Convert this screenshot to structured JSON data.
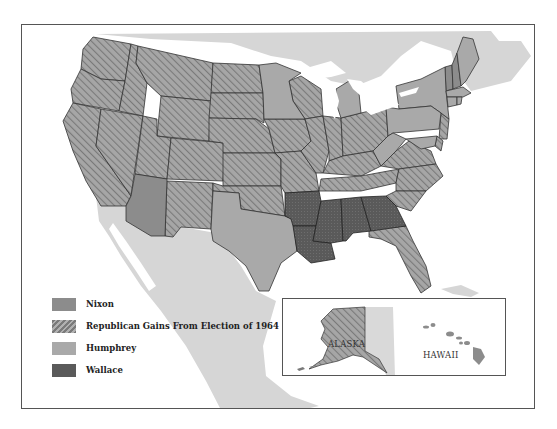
{
  "map": {
    "title": "1968 Presidential Election",
    "colors": {
      "nixon": "#8c8c8c",
      "republican_gain": "#9a9a9a",
      "humphrey": "#a9a9a9",
      "wallace": "#5a5a5a",
      "land_other": "#d6d6d6",
      "water": "#ffffff",
      "border": "#333333"
    }
  },
  "legend": {
    "items": [
      {
        "key": "nixon",
        "label": "Nixon"
      },
      {
        "key": "republican_gain",
        "label": "Republican Gains From Election of 1964"
      },
      {
        "key": "humphrey",
        "label": "Humphrey"
      },
      {
        "key": "wallace",
        "label": "Wallace"
      }
    ]
  },
  "states": {
    "republican_gain": [
      "Washington",
      "Oregon",
      "California",
      "Idaho",
      "Nevada",
      "Utah",
      "Montana",
      "Wyoming",
      "Colorado",
      "New Mexico",
      "North Dakota",
      "South Dakota",
      "Nebraska",
      "Kansas",
      "Oklahoma",
      "Iowa",
      "Missouri",
      "Wisconsin",
      "Illinois",
      "Indiana",
      "Ohio",
      "Kentucky",
      "Tennessee",
      "Virginia",
      "North Carolina",
      "South Carolina",
      "Florida",
      "New Jersey",
      "Delaware",
      "Alaska"
    ],
    "nixon": [
      "Arizona",
      "Vermont",
      "New Hampshire"
    ],
    "humphrey": [
      "Minnesota",
      "Michigan",
      "Texas",
      "New York",
      "Pennsylvania",
      "West Virginia",
      "Maryland",
      "Maine",
      "Massachusetts",
      "Rhode Island",
      "Connecticut",
      "Hawaii"
    ],
    "wallace": [
      "Arkansas",
      "Louisiana",
      "Mississippi",
      "Alabama",
      "Georgia"
    ]
  },
  "inset": {
    "alaska_label": "ALASKA",
    "hawaii_label": "HAWAII"
  }
}
